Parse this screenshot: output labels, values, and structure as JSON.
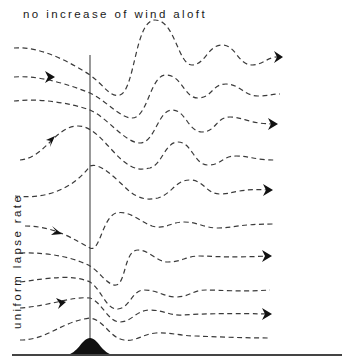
{
  "diagram": {
    "title": "no increase of wind aloft",
    "side_label": "uniform lapse rate",
    "colors": {
      "background": "#ffffff",
      "lines": "#3a3a3a",
      "mountain": "#111111"
    },
    "elements": {
      "streamlines_count": 10,
      "vertical_reference_line": "vertical line above mountain peak",
      "ground_line": "horizontal ground surface",
      "mountain": "isolated bell-shaped ridge",
      "arrows": "flow direction left to right"
    }
  }
}
